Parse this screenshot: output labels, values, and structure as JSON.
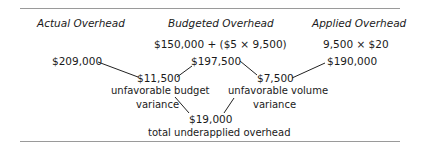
{
  "headers": {
    "actual": "Actual Overhead",
    "budgeted": "Budgeted Overhead",
    "applied": "Applied Overhead"
  },
  "formulas": {
    "budgeted": "$150,000 + ($5 × 9,500)",
    "applied": "9,500 × $20"
  },
  "values": {
    "actual": "$209,000",
    "budgeted": "$197,500",
    "applied": "$190,000",
    "budget_variance": "$11,500",
    "volume_variance": "$7,500",
    "total": "$19,000"
  },
  "labels": {
    "budget_variance_line1": "unfavorable budget",
    "budget_variance_line2": "variance",
    "volume_variance_line1": "unfavorable volume",
    "volume_variance_line2": "variance",
    "total": "total underapplied overhead"
  }
}
